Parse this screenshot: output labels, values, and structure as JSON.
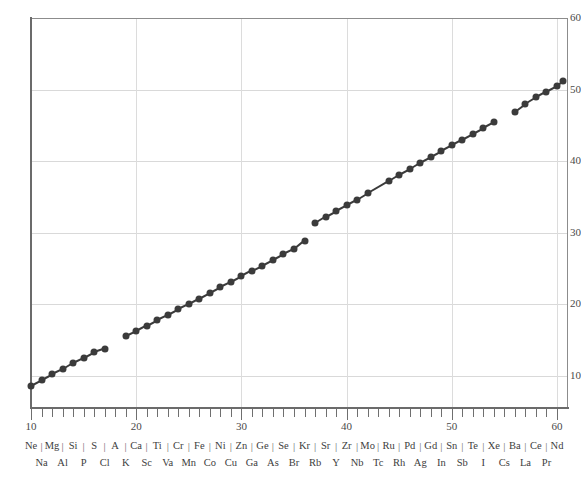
{
  "chart_data": {
    "type": "scatter",
    "title": "",
    "subtitle": "",
    "xlabel": "",
    "ylabel": "",
    "xlim": [
      10,
      60.7
    ],
    "ylim": [
      5.5,
      60
    ],
    "grid": true,
    "legend_position": "none",
    "x_ticks_major": [
      10,
      20,
      30,
      40,
      50,
      60
    ],
    "x_tick_labels": [
      "10",
      "20",
      "30",
      "40",
      "50",
      "60"
    ],
    "x_ticks_minor_step": 1,
    "y_ticks": [
      10,
      20,
      30,
      40,
      50,
      60
    ],
    "y_tick_labels": [
      "10",
      "20",
      "30",
      "40",
      "50",
      "60"
    ],
    "marker_color": "#3b3b3b",
    "line_color": "#3b3b3b",
    "grid_color": "#d9d9d9",
    "axis_color": "#6b6b6b",
    "series": [
      {
        "name": "K series",
        "connected": true,
        "points": [
          {
            "element": "Ne",
            "x": 10,
            "y": 8.6
          },
          {
            "element": "Na",
            "x": 11,
            "y": 9.4
          },
          {
            "element": "Mg",
            "x": 12,
            "y": 10.2
          },
          {
            "element": "Al",
            "x": 13,
            "y": 10.9
          },
          {
            "element": "Si",
            "x": 14,
            "y": 11.8
          },
          {
            "element": "P",
            "x": 15,
            "y": 12.5
          },
          {
            "element": "S",
            "x": 16,
            "y": 13.3
          },
          {
            "element": "Cl",
            "x": 17,
            "y": 13.8
          }
        ]
      },
      {
        "name": "K series (second run)",
        "connected": true,
        "points": [
          {
            "element": "K",
            "x": 19,
            "y": 15.5
          },
          {
            "element": "Ca",
            "x": 20,
            "y": 16.2
          },
          {
            "element": "Sc",
            "x": 21,
            "y": 17.0
          },
          {
            "element": "Ti",
            "x": 22,
            "y": 17.8
          },
          {
            "element": "Va",
            "x": 23,
            "y": 18.5
          },
          {
            "element": "Cr",
            "x": 24,
            "y": 19.3
          },
          {
            "element": "Mn",
            "x": 25,
            "y": 20.0
          },
          {
            "element": "Fe",
            "x": 26,
            "y": 20.8
          },
          {
            "element": "Co",
            "x": 27,
            "y": 21.6
          },
          {
            "element": "Ni",
            "x": 28,
            "y": 22.4
          },
          {
            "element": "Cu",
            "x": 29,
            "y": 23.1
          },
          {
            "element": "Zn",
            "x": 30,
            "y": 23.9
          },
          {
            "element": "Ga",
            "x": 31,
            "y": 24.7
          },
          {
            "element": "Ge",
            "x": 32,
            "y": 25.4
          },
          {
            "element": "As",
            "x": 33,
            "y": 26.2
          },
          {
            "element": "Se",
            "x": 34,
            "y": 27.0
          },
          {
            "element": "Br",
            "x": 35,
            "y": 27.7
          },
          {
            "element": "Kr",
            "x": 36,
            "y": 28.9
          }
        ]
      },
      {
        "name": "L series",
        "connected": true,
        "points": [
          {
            "element": "Rb",
            "x": 37,
            "y": 31.3
          },
          {
            "element": "Sr",
            "x": 38,
            "y": 32.2
          },
          {
            "element": "Y",
            "x": 39,
            "y": 33.0
          },
          {
            "element": "Zr",
            "x": 40,
            "y": 33.8
          },
          {
            "element": "Nb",
            "x": 41,
            "y": 34.6
          },
          {
            "element": "Mo",
            "x": 42,
            "y": 35.5
          },
          {
            "element": "Tc",
            "x": 44,
            "y": 37.2
          },
          {
            "element": "Ru",
            "x": 45,
            "y": 38.1
          },
          {
            "element": "Rh",
            "x": 46,
            "y": 38.9
          },
          {
            "element": "Pd",
            "x": 47,
            "y": 39.8
          },
          {
            "element": "Ag",
            "x": 48,
            "y": 40.6
          },
          {
            "element": "Gd",
            "x": 49,
            "y": 41.4
          },
          {
            "element": "In",
            "x": 50,
            "y": 42.2
          },
          {
            "element": "Sn",
            "x": 51,
            "y": 43.0
          },
          {
            "element": "Sb",
            "x": 52,
            "y": 43.8
          },
          {
            "element": "Te",
            "x": 53,
            "y": 44.6
          },
          {
            "element": "I",
            "x": 54,
            "y": 45.4
          }
        ]
      },
      {
        "name": "L series (second run)",
        "connected": true,
        "points": [
          {
            "element": "Cs",
            "x": 56,
            "y": 46.9
          },
          {
            "element": "Ba",
            "x": 57,
            "y": 48.0
          },
          {
            "element": "La",
            "x": 58,
            "y": 48.9
          },
          {
            "element": "Ce",
            "x": 59,
            "y": 49.7
          },
          {
            "element": "Pr",
            "x": 60,
            "y": 50.5
          },
          {
            "element": "Nd",
            "x": 60.6,
            "y": 51.2
          }
        ]
      }
    ],
    "element_labels": {
      "top_row": [
        {
          "symbol": "Ne",
          "z": 10
        },
        {
          "symbol": "Mg",
          "z": 12
        },
        {
          "symbol": "Si",
          "z": 14
        },
        {
          "symbol": "S",
          "z": 16
        },
        {
          "symbol": "A",
          "z": 18
        },
        {
          "symbol": "Ca",
          "z": 20
        },
        {
          "symbol": "Ti",
          "z": 22
        },
        {
          "symbol": "Cr",
          "z": 24
        },
        {
          "symbol": "Fe",
          "z": 26
        },
        {
          "symbol": "Ni",
          "z": 28
        },
        {
          "symbol": "Zn",
          "z": 30
        },
        {
          "symbol": "Ge",
          "z": 32
        },
        {
          "symbol": "Se",
          "z": 34
        },
        {
          "symbol": "Kr",
          "z": 36
        },
        {
          "symbol": "Sr",
          "z": 38
        },
        {
          "symbol": "Zr",
          "z": 40
        },
        {
          "symbol": "Mo",
          "z": 42
        },
        {
          "symbol": "Ru",
          "z": 44
        },
        {
          "symbol": "Pd",
          "z": 46
        },
        {
          "symbol": "Gd",
          "z": 48
        },
        {
          "symbol": "Sn",
          "z": 50
        },
        {
          "symbol": "Te",
          "z": 52
        },
        {
          "symbol": "Xe",
          "z": 54
        },
        {
          "symbol": "Ba",
          "z": 56
        },
        {
          "symbol": "Ce",
          "z": 58
        },
        {
          "symbol": "Nd",
          "z": 60
        }
      ],
      "bottom_row": [
        {
          "symbol": "Na",
          "z": 11
        },
        {
          "symbol": "Al",
          "z": 13
        },
        {
          "symbol": "P",
          "z": 15
        },
        {
          "symbol": "Cl",
          "z": 17
        },
        {
          "symbol": "K",
          "z": 19
        },
        {
          "symbol": "Sc",
          "z": 21
        },
        {
          "symbol": "Va",
          "z": 23
        },
        {
          "symbol": "Mn",
          "z": 25
        },
        {
          "symbol": "Co",
          "z": 27
        },
        {
          "symbol": "Cu",
          "z": 29
        },
        {
          "symbol": "Ga",
          "z": 31
        },
        {
          "symbol": "As",
          "z": 33
        },
        {
          "symbol": "Br",
          "z": 35
        },
        {
          "symbol": "Rb",
          "z": 37
        },
        {
          "symbol": "Y",
          "z": 39
        },
        {
          "symbol": "Nb",
          "z": 41
        },
        {
          "symbol": "Tc",
          "z": 43
        },
        {
          "symbol": "Rh",
          "z": 45
        },
        {
          "symbol": "Ag",
          "z": 47
        },
        {
          "symbol": "In",
          "z": 49
        },
        {
          "symbol": "Sb",
          "z": 51
        },
        {
          "symbol": "I",
          "z": 53
        },
        {
          "symbol": "Cs",
          "z": 55
        },
        {
          "symbol": "La",
          "z": 57
        },
        {
          "symbol": "Pr",
          "z": 59
        }
      ],
      "separator_glyph": "|",
      "separator_positions": [
        11,
        13,
        15,
        17,
        19,
        21,
        23,
        25,
        27,
        29,
        31,
        33,
        35,
        37,
        39,
        41,
        43,
        45,
        47,
        49,
        51,
        53,
        55,
        57,
        59
      ]
    }
  }
}
